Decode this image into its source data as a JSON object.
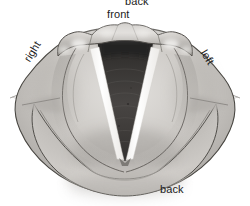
{
  "figure": {
    "style": "grayscale pencil-shaded anatomical illustration",
    "background_color": "#ffffff",
    "labels": {
      "back_top": "back",
      "front": "front",
      "right": "right",
      "left": "left",
      "back_bottom": "back"
    },
    "label_color": "#1b1b1b",
    "parts": {
      "epiglottis": "epiglottis",
      "vocal_folds": "vocal-folds",
      "glottis": "glottis",
      "trachea": "trachea",
      "aryepiglottic_fold_right": "aryepiglottic-fold-right",
      "aryepiglottic_fold_left": "aryepiglottic-fold-left",
      "arytenoid_region": "arytenoid-region",
      "pharyngeal_wall": "pharyngeal-wall"
    },
    "colors": {
      "tissue_light": "#d6d3cf",
      "tissue_mid": "#b4b1ad",
      "tissue_dark": "#8d8a86",
      "outline": "#3b3a38",
      "glottis_dark": "#3a3836",
      "trachea_deep": "#2a2826",
      "vocal_fold_white": "#fdfdfc",
      "highlight": "#efeeec"
    }
  }
}
